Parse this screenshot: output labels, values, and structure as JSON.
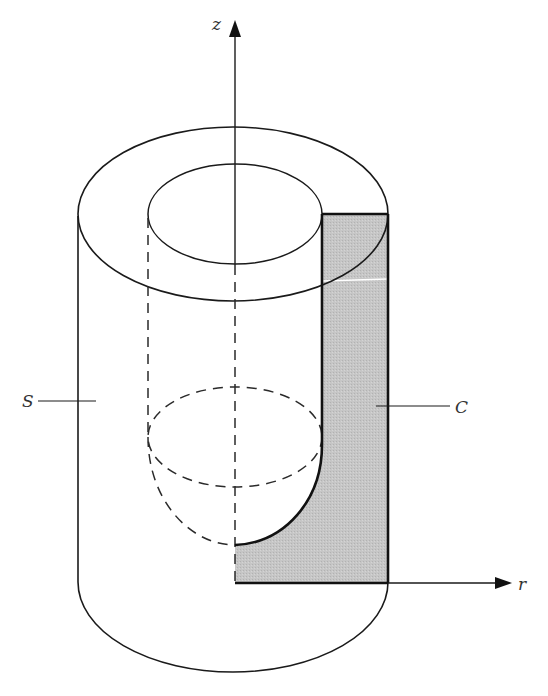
{
  "figure": {
    "type": "solid-of-revolution-diagram",
    "labels": {
      "z_axis": "z",
      "r_axis": "r",
      "surface": "S",
      "region": "C"
    },
    "colors": {
      "stroke": "#1a1a1a",
      "region_fill": "#c4c4c4",
      "background": "#ffffff"
    }
  }
}
